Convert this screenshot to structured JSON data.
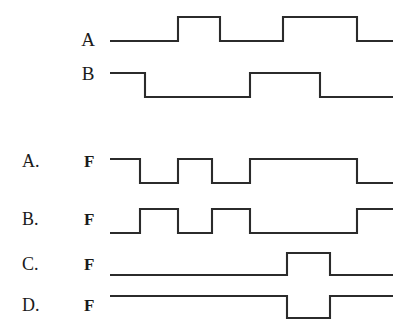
{
  "page": {
    "background_color": "#ffffff",
    "line_color": "#2b2b2b",
    "text_color": "#1a1a1a"
  },
  "chart_data": {
    "type": "line",
    "subtype": "digital-timing-diagram",
    "title": "",
    "xlabel": "",
    "ylabel": "",
    "grid": false,
    "legend": "none",
    "xlim": [
      110,
      393
    ],
    "note": "Each trace is a two-level digital waveform; y values are 0 (low) or 1 (high). x values are pixel-time positions along the common time axis.",
    "traces": [
      {
        "name": "A",
        "label": "A",
        "role": "input",
        "y_low": 41,
        "y_high": 17,
        "points": [
          {
            "x": 110,
            "y": 0
          },
          {
            "x": 178,
            "y": 0
          },
          {
            "x": 178,
            "y": 1
          },
          {
            "x": 220,
            "y": 1
          },
          {
            "x": 220,
            "y": 0
          },
          {
            "x": 283,
            "y": 0
          },
          {
            "x": 283,
            "y": 1
          },
          {
            "x": 357,
            "y": 1
          },
          {
            "x": 357,
            "y": 0
          },
          {
            "x": 393,
            "y": 0
          }
        ]
      },
      {
        "name": "B",
        "label": "B",
        "role": "input",
        "y_low": 97,
        "y_high": 73,
        "points": [
          {
            "x": 110,
            "y": 1
          },
          {
            "x": 145,
            "y": 1
          },
          {
            "x": 145,
            "y": 0
          },
          {
            "x": 250,
            "y": 0
          },
          {
            "x": 250,
            "y": 1
          },
          {
            "x": 320,
            "y": 1
          },
          {
            "x": 320,
            "y": 0
          },
          {
            "x": 393,
            "y": 0
          }
        ]
      },
      {
        "name": "F_A",
        "label": "F",
        "role": "option",
        "option": "A.",
        "y_low": 183,
        "y_high": 159,
        "points": [
          {
            "x": 110,
            "y": 1
          },
          {
            "x": 140,
            "y": 1
          },
          {
            "x": 140,
            "y": 0
          },
          {
            "x": 178,
            "y": 0
          },
          {
            "x": 178,
            "y": 1
          },
          {
            "x": 212,
            "y": 1
          },
          {
            "x": 212,
            "y": 0
          },
          {
            "x": 250,
            "y": 0
          },
          {
            "x": 250,
            "y": 1
          },
          {
            "x": 357,
            "y": 1
          },
          {
            "x": 357,
            "y": 0
          },
          {
            "x": 393,
            "y": 0
          }
        ]
      },
      {
        "name": "F_B",
        "label": "F",
        "role": "option",
        "option": "B.",
        "y_low": 233,
        "y_high": 209,
        "points": [
          {
            "x": 110,
            "y": 0
          },
          {
            "x": 140,
            "y": 0
          },
          {
            "x": 140,
            "y": 1
          },
          {
            "x": 178,
            "y": 1
          },
          {
            "x": 178,
            "y": 0
          },
          {
            "x": 212,
            "y": 0
          },
          {
            "x": 212,
            "y": 1
          },
          {
            "x": 250,
            "y": 1
          },
          {
            "x": 250,
            "y": 0
          },
          {
            "x": 357,
            "y": 0
          },
          {
            "x": 357,
            "y": 1
          },
          {
            "x": 393,
            "y": 1
          }
        ]
      },
      {
        "name": "F_C",
        "label": "F",
        "role": "option",
        "option": "C.",
        "y_low": 275,
        "y_high": 253,
        "points": [
          {
            "x": 110,
            "y": 0
          },
          {
            "x": 287,
            "y": 0
          },
          {
            "x": 287,
            "y": 1
          },
          {
            "x": 330,
            "y": 1
          },
          {
            "x": 330,
            "y": 0
          },
          {
            "x": 393,
            "y": 0
          }
        ]
      },
      {
        "name": "F_D",
        "label": "F",
        "role": "option",
        "option": "D.",
        "y_low": 318,
        "y_high": 296,
        "points": [
          {
            "x": 110,
            "y": 1
          },
          {
            "x": 287,
            "y": 1
          },
          {
            "x": 287,
            "y": 0
          },
          {
            "x": 330,
            "y": 0
          },
          {
            "x": 330,
            "y": 1
          },
          {
            "x": 393,
            "y": 1
          }
        ]
      }
    ]
  },
  "inputs": {
    "signal_a": {
      "label": "A",
      "label_x": 88,
      "label_y": 46
    },
    "signal_b": {
      "label": "B",
      "label_x": 88,
      "label_y": 80
    }
  },
  "options": [
    {
      "key": "A.",
      "key_x": 22,
      "key_y": 167,
      "f_label": "F",
      "f_x": 84,
      "f_y": 167
    },
    {
      "key": "B.",
      "key_x": 22,
      "key_y": 225,
      "f_label": "F",
      "f_x": 84,
      "f_y": 225
    },
    {
      "key": "C.",
      "key_x": 22,
      "key_y": 270,
      "f_label": "F",
      "f_x": 84,
      "f_y": 270
    },
    {
      "key": "D.",
      "key_x": 22,
      "key_y": 311,
      "f_label": "F",
      "f_x": 84,
      "f_y": 311
    }
  ]
}
